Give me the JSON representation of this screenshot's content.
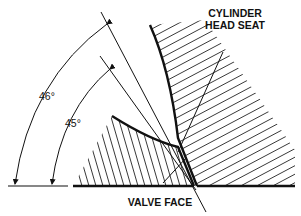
{
  "diagram": {
    "labels": {
      "seat_line1": "CYLINDER",
      "seat_line2": "HEAD SEAT",
      "valve_face": "VALVE FACE",
      "angle_seat": "46°",
      "angle_face": "45°"
    },
    "colors": {
      "ink": "#111111",
      "background": "#ffffff"
    }
  }
}
